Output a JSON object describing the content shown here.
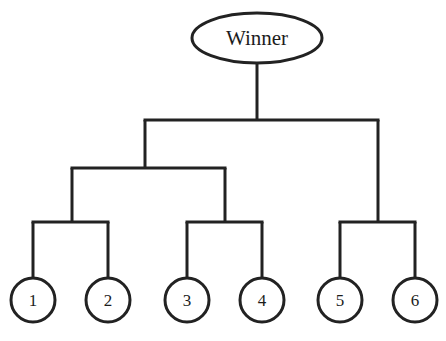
{
  "diagram": {
    "type": "single-elimination-tournament-bracket",
    "title_node": {
      "label": "Winner",
      "shape": "ellipse",
      "cx": 257,
      "cy": 38,
      "rx": 65,
      "ry": 25
    },
    "style": {
      "background_color": "#ffffff",
      "line_color": "#222222",
      "text_color": "#1c1c1c",
      "stroke_width": 3,
      "node_stroke_width": 3
    },
    "seeds": [
      {
        "label": "1",
        "cx": 33,
        "cy": 300,
        "r": 22
      },
      {
        "label": "2",
        "cx": 108,
        "cy": 300,
        "r": 22
      },
      {
        "label": "3",
        "cx": 187,
        "cy": 300,
        "r": 22
      },
      {
        "label": "4",
        "cx": 262,
        "cy": 300,
        "r": 22
      },
      {
        "label": "5",
        "cx": 340,
        "cy": 300,
        "r": 22
      },
      {
        "label": "6",
        "cx": 415,
        "cy": 300,
        "r": 22
      }
    ],
    "connectors": {
      "winner_stem": {
        "x": 257,
        "y1": 63,
        "y2": 120
      },
      "top_bar": {
        "y": 120,
        "x1": 145,
        "x2": 378
      },
      "left_drop": {
        "x": 145,
        "y1": 120,
        "y2": 168
      },
      "right_drop": {
        "x": 378,
        "y1": 120,
        "y2": 222
      },
      "mid_bar": {
        "y": 168,
        "x1": 72,
        "x2": 225
      },
      "pair_drops": [
        {
          "x": 72,
          "y1": 168,
          "y2": 222
        },
        {
          "x": 225,
          "y1": 168,
          "y2": 222
        }
      ],
      "pair_bars": [
        {
          "y": 222,
          "x1": 33,
          "x2": 108
        },
        {
          "y": 222,
          "x1": 187,
          "x2": 262
        },
        {
          "y": 222,
          "x1": 340,
          "x2": 415
        }
      ],
      "seed_stems": [
        {
          "x": 33,
          "y1": 222,
          "y2": 278
        },
        {
          "x": 108,
          "y1": 222,
          "y2": 278
        },
        {
          "x": 187,
          "y1": 222,
          "y2": 278
        },
        {
          "x": 262,
          "y1": 222,
          "y2": 278
        },
        {
          "x": 340,
          "y1": 222,
          "y2": 278
        },
        {
          "x": 415,
          "y1": 222,
          "y2": 278
        }
      ]
    }
  }
}
